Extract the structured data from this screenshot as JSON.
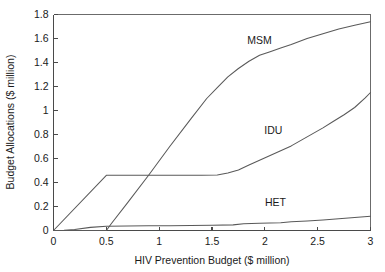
{
  "chart_data": {
    "type": "line",
    "title": "",
    "xlabel": "HIV Prevention Budget ($ million)",
    "ylabel": "Budget Allocations ($ million)",
    "xlim": [
      0,
      3
    ],
    "ylim": [
      0,
      1.8
    ],
    "grid": false,
    "legend_position": "inline-annotations",
    "xticks": [
      0,
      0.5,
      1,
      1.5,
      2,
      2.5,
      3
    ],
    "xtick_labels": [
      "0",
      "0.5",
      "1",
      "1.5",
      "2",
      "2.5",
      "3"
    ],
    "yticks": [
      0,
      0.2,
      0.4,
      0.6,
      0.8,
      1,
      1.2,
      1.4,
      1.6,
      1.8
    ],
    "ytick_labels": [
      "0",
      "0.2",
      "0.4",
      "0.6",
      "0.8",
      "1",
      "1.2",
      "1.4",
      "1.6",
      "1.8"
    ],
    "line_color": "#595959",
    "axis_color": "#4a4a4a",
    "series": [
      {
        "name": "MSM",
        "label_x": 1.95,
        "label_y": 1.555,
        "x": [
          0.0,
          0.5,
          0.55,
          0.7,
          0.9,
          1.1,
          1.3,
          1.45,
          1.55,
          1.65,
          1.75,
          1.85,
          1.95,
          2.05,
          2.15,
          2.25,
          2.4,
          2.55,
          2.7,
          2.85,
          3.0
        ],
        "y": [
          0.0,
          0.0,
          0.06,
          0.23,
          0.46,
          0.7,
          0.93,
          1.1,
          1.19,
          1.28,
          1.35,
          1.41,
          1.46,
          1.49,
          1.52,
          1.55,
          1.6,
          1.64,
          1.68,
          1.71,
          1.74
        ]
      },
      {
        "name": "IDU",
        "label_x": 2.08,
        "label_y": 0.805,
        "x": [
          0.0,
          0.5,
          0.8,
          1.1,
          1.4,
          1.55,
          1.65,
          1.75,
          1.85,
          1.95,
          2.05,
          2.15,
          2.25,
          2.35,
          2.45,
          2.55,
          2.65,
          2.75,
          2.85,
          2.95,
          3.0
        ],
        "y": [
          0.0,
          0.46,
          0.46,
          0.46,
          0.46,
          0.462,
          0.48,
          0.505,
          0.545,
          0.585,
          0.625,
          0.665,
          0.705,
          0.755,
          0.805,
          0.855,
          0.91,
          0.965,
          1.025,
          1.105,
          1.15
        ]
      },
      {
        "name": "HET",
        "label_x": 2.1,
        "label_y": 0.205,
        "x": [
          0.0,
          0.1,
          0.2,
          0.35,
          0.5,
          0.7,
          0.9,
          1.1,
          1.3,
          1.5,
          1.7,
          1.8,
          1.95,
          2.05,
          2.15,
          2.25,
          2.4,
          2.55,
          2.7,
          2.85,
          3.0
        ],
        "y": [
          0.0,
          0.002,
          0.008,
          0.026,
          0.036,
          0.038,
          0.039,
          0.04,
          0.041,
          0.043,
          0.047,
          0.057,
          0.06,
          0.062,
          0.064,
          0.073,
          0.08,
          0.088,
          0.098,
          0.108,
          0.118
        ]
      }
    ]
  }
}
